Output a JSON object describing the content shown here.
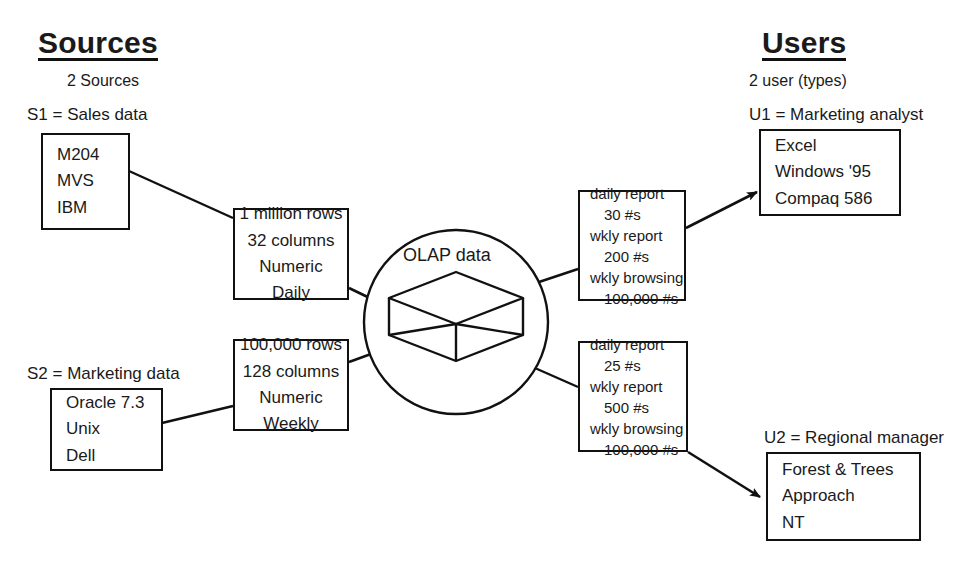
{
  "diagram": {
    "title_left": "Sources",
    "title_right": "Users",
    "subtitle_left": "2 Sources",
    "subtitle_right": "2 user (types)",
    "hub_label": "OLAP data",
    "hub_icon": "cube-icon"
  },
  "sources": [
    {
      "id": "S1",
      "label": "S1 = Sales data",
      "items": [
        "M204",
        "MVS",
        "IBM"
      ]
    },
    {
      "id": "S2",
      "label": "S2 = Marketing data",
      "items": [
        "Oracle 7.3",
        "Unix",
        "Dell"
      ]
    }
  ],
  "feeds": [
    {
      "id": "feed-sales",
      "items": [
        "1 million rows",
        "32 columns",
        "Numeric",
        "Daily"
      ]
    },
    {
      "id": "feed-marketing",
      "items": [
        "100,000 rows",
        "128 columns",
        "Numeric",
        "Weekly"
      ]
    }
  ],
  "reports": [
    {
      "id": "report-analyst",
      "items": [
        {
          "text": "daily report",
          "indent": false
        },
        {
          "text": "30 #s",
          "indent": true
        },
        {
          "text": "wkly report",
          "indent": false
        },
        {
          "text": "200 #s",
          "indent": true
        },
        {
          "text": "wkly browsing",
          "indent": false
        },
        {
          "text": "100,000 #s",
          "indent": true
        }
      ]
    },
    {
      "id": "report-manager",
      "items": [
        {
          "text": "daily report",
          "indent": false
        },
        {
          "text": "25 #s",
          "indent": true
        },
        {
          "text": "wkly report",
          "indent": false
        },
        {
          "text": "500 #s",
          "indent": true
        },
        {
          "text": "wkly browsing",
          "indent": false
        },
        {
          "text": "100,000 #s",
          "indent": true
        }
      ]
    }
  ],
  "users": [
    {
      "id": "U1",
      "label": "U1 = Marketing analyst",
      "items": [
        "Excel",
        "Windows '95",
        "Compaq 586"
      ]
    },
    {
      "id": "U2",
      "label": "U2 = Regional manager",
      "items": [
        "Forest & Trees",
        "Approach",
        "NT"
      ]
    }
  ],
  "colors": {
    "stroke": "#111111",
    "background": "#ffffff",
    "text": "#1a1a1a"
  }
}
